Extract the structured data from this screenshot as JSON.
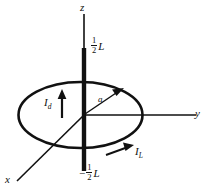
{
  "figure": {
    "background_color": "#ffffff",
    "ink_color": "#111111",
    "axes": [
      {
        "name": "z",
        "label": "z",
        "direction": "up"
      },
      {
        "name": "y",
        "label": "y",
        "direction": "right"
      },
      {
        "name": "x",
        "label": "x",
        "direction": "down-left"
      }
    ],
    "labels": {
      "z_axis": "z",
      "y_axis": "y",
      "x_axis": "x",
      "half_length_top_numerator": "1",
      "half_length_top_denominator": "2",
      "half_length_top_symbol": "L",
      "half_length_bottom_sign": "−",
      "half_length_bottom_numerator": "1",
      "half_length_bottom_denominator": "2",
      "half_length_bottom_symbol": "L",
      "radius": "a",
      "displacement_current": "I",
      "displacement_current_sub": "d",
      "line_current": "I",
      "line_current_sub": "L"
    },
    "shapes": {
      "loop_name": "amperian-loop-ellipse",
      "rod_name": "current-carrying-rod"
    }
  }
}
